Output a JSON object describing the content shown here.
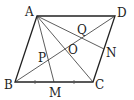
{
  "diagram": {
    "type": "geometry",
    "points": {
      "A": {
        "label": "A",
        "x": 37,
        "y": 16
      },
      "B": {
        "label": "B",
        "x": 15,
        "y": 82
      },
      "C": {
        "label": "C",
        "x": 93,
        "y": 82
      },
      "D": {
        "label": "D",
        "x": 115,
        "y": 16
      },
      "M": {
        "label": "M",
        "x": 54,
        "y": 82
      },
      "N": {
        "label": "N",
        "x": 104,
        "y": 49
      },
      "O": {
        "label": "O",
        "x": 65,
        "y": 49
      },
      "P": {
        "label": "P",
        "x": 48.3,
        "y": 60
      },
      "Q": {
        "label": "Q",
        "x": 81.7,
        "y": 38
      }
    },
    "segments": [
      "AB",
      "BC",
      "CD",
      "DA",
      "AC",
      "BD",
      "AM",
      "AN"
    ],
    "equal_marks": [
      "BM",
      "MC"
    ],
    "colors": {
      "stroke": "#222222",
      "background": "#ffffff"
    }
  }
}
